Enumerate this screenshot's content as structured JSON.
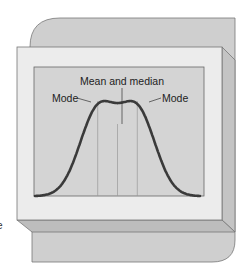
{
  "figure": {
    "labels": {
      "mode_left": "Mode",
      "center": "Mean and median",
      "mode_right": "Mode"
    },
    "edge_fragment": "e"
  },
  "chart_data": {
    "type": "line",
    "title": "",
    "xlabel": "",
    "ylabel": "",
    "annotations": [
      "Mode",
      "Mean and median",
      "Mode"
    ],
    "x": [
      0.0,
      0.1,
      0.2,
      0.3,
      0.38,
      0.5,
      0.62,
      0.7,
      0.8,
      0.9,
      1.0
    ],
    "y": [
      0.0,
      0.15,
      0.55,
      0.88,
      1.0,
      0.75,
      1.0,
      0.88,
      0.55,
      0.15,
      0.0
    ],
    "xlim": [
      0,
      1
    ],
    "ylim": [
      0,
      1.05
    ],
    "reference_lines_x": [
      0.38,
      0.5,
      0.62
    ],
    "colors": {
      "curve": "#3a3a3a",
      "plot_bg": "#d4d4d4",
      "frame": "#ececec",
      "back_panel": "#cfcfcf"
    }
  }
}
